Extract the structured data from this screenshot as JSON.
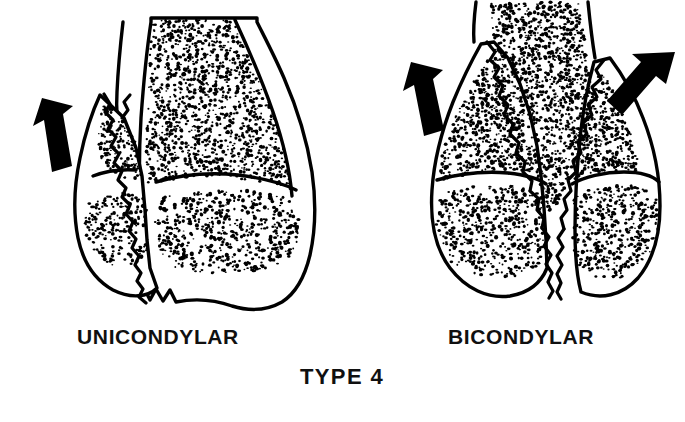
{
  "figure": {
    "title_label": "TYPE 4",
    "background_color": "#ffffff",
    "ink_color": "#000000",
    "style": "line drawing with stippled cancellous bone"
  },
  "panels": [
    {
      "id": "unicondylar",
      "caption": "UNICONDYLAR",
      "caption_x": 158,
      "caption_y": 344,
      "description": "distal humerus with single oblique condylar fracture line separating one condyle",
      "arrows": [
        {
          "name": "displacement-arrow-left",
          "direction": "up-left",
          "x": 52,
          "y": 150
        }
      ],
      "fracture_count": 1
    },
    {
      "id": "bicondylar",
      "caption": "BICONDYLAR",
      "caption_x": 521,
      "caption_y": 344,
      "description": "distal humerus with T/Y shaped fracture separating both condyles",
      "arrows": [
        {
          "name": "displacement-arrow-left",
          "direction": "up-left",
          "x": 430,
          "y": 110
        },
        {
          "name": "displacement-arrow-right",
          "direction": "up-right",
          "x": 636,
          "y": 100
        }
      ],
      "fracture_count": 2
    }
  ],
  "type_label": {
    "text": "TYPE 4",
    "x": 342,
    "y": 384
  }
}
